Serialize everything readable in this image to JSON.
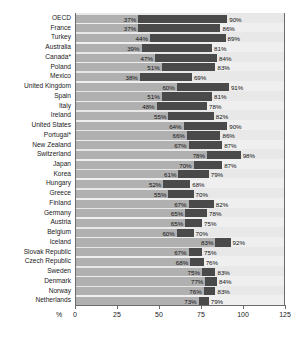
{
  "chart_data": {
    "type": "bar",
    "orientation": "horizontal",
    "title": "",
    "subtitle": "",
    "xlabel": "%",
    "ylabel": "",
    "xlim": [
      0,
      125
    ],
    "grid": true,
    "legend_position": "none",
    "xticks": [
      "0",
      "25",
      "50",
      "75",
      "100",
      "125"
    ],
    "xtick_values": [
      0,
      25,
      50,
      75,
      100,
      125
    ],
    "categories": [
      "OECD",
      "France",
      "Turkey",
      "Australia",
      "Canada*",
      "Poland",
      "Mexico",
      "United Kingdom",
      "Spain",
      "Italy",
      "Ireland",
      "United States",
      "Portugal*",
      "New Zealand",
      "Switzerland",
      "Japan",
      "Korea",
      "Hungary",
      "Greece",
      "Finland",
      "Germany",
      "Austria",
      "Belgium",
      "Iceland",
      "Slovak Republic",
      "Czech Republic",
      "Sweden",
      "Denmark",
      "Norway",
      "Netherlands"
    ],
    "series": [
      {
        "name": "lower",
        "values": [
          37,
          37,
          44,
          39,
          47,
          51,
          38,
          60,
          51,
          48,
          55,
          64,
          66,
          67,
          78,
          70,
          61,
          52,
          55,
          67,
          65,
          65,
          60,
          83,
          67,
          68,
          75,
          77,
          76,
          73
        ],
        "labels": [
          "37%",
          "37%",
          "44%",
          "39%",
          "47%",
          "51%",
          "38%",
          "60%",
          "51%",
          "48%",
          "55%",
          "64%",
          "66%",
          "67%",
          "78%",
          "70%",
          "61%",
          "52%",
          "55%",
          "67%",
          "65%",
          "65%",
          "60%",
          "83%",
          "67%",
          "68%",
          "75%",
          "77%",
          "76%",
          "73%"
        ],
        "color": "#b0b0b0"
      },
      {
        "name": "upper",
        "values": [
          90,
          86,
          89,
          81,
          84,
          83,
          69,
          91,
          81,
          78,
          82,
          90,
          86,
          87,
          98,
          87,
          79,
          68,
          70,
          82,
          78,
          75,
          70,
          92,
          75,
          76,
          83,
          84,
          83,
          79
        ],
        "labels": [
          "90%",
          "86%",
          "89%",
          "81%",
          "84%",
          "83%",
          "69%",
          "91%",
          "81%",
          "78%",
          "82%",
          "90%",
          "86%",
          "87%",
          "98%",
          "87%",
          "79%",
          "68%",
          "70%",
          "82%",
          "78%",
          "75%",
          "70%",
          "92%",
          "75%",
          "76%",
          "83%",
          "84%",
          "83%",
          "79%"
        ],
        "color": "#4a4a4a"
      }
    ]
  }
}
